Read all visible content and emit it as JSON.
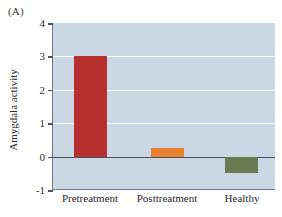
{
  "panel": {
    "label": "(A)"
  },
  "axis": {
    "ylabel": "Amygdala activity",
    "yticks": [
      "4",
      "3",
      "2",
      "1",
      "0",
      "-1"
    ],
    "xlabels": [
      "Pretreatment",
      "Posttreatment",
      "Healthy"
    ]
  },
  "colors": {
    "plot_background": "#ccd7e6",
    "gridline": "#ffffff",
    "axis": "#6a7a8c",
    "zero_line": "#4a5564",
    "bar_pretreatment": "#b6302f",
    "bar_posttreatment": "#e8822e",
    "bar_healthy": "#6b7b51"
  },
  "chart_data": {
    "type": "bar",
    "title": "",
    "xlabel": "",
    "ylabel": "Amygdala activity",
    "categories": [
      "Pretreatment",
      "Posttreatment",
      "Healthy"
    ],
    "values": [
      3.0,
      0.25,
      -0.5
    ],
    "colors": [
      "#b6302f",
      "#e8822e",
      "#6b7b51"
    ],
    "ylim": [
      -1,
      4
    ],
    "yticks": [
      -1,
      0,
      1,
      2,
      3,
      4
    ],
    "grid": true,
    "legend": "none"
  }
}
